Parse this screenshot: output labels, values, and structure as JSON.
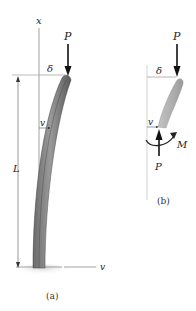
{
  "figure_a": {
    "caption": "(a)",
    "labels": {
      "x_axis": "x",
      "v_axis": "v",
      "load": "P",
      "deflection_tip": "δ",
      "deflection_local": "v",
      "length": "L"
    }
  },
  "figure_b": {
    "caption": "(b)",
    "labels": {
      "load_top": "P",
      "load_bottom": "P",
      "deflection_tip": "δ",
      "deflection_local": "v",
      "moment": "M"
    }
  },
  "colors": {
    "column_dark": "#5a5a5a",
    "column_light": "#b8b8b8",
    "axis": "#888888",
    "arrow": "#111111",
    "ground": "#d8d8d8"
  }
}
